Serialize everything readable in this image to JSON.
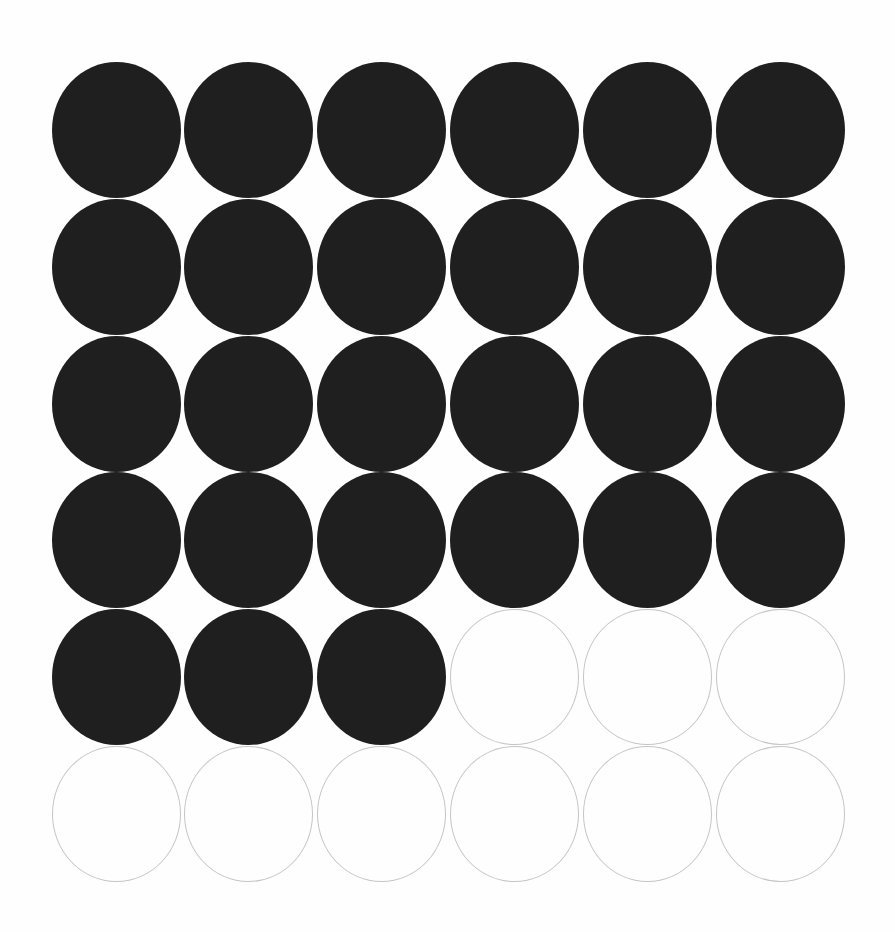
{
  "figure": {
    "type": "dot-grid",
    "rows": 6,
    "cols": 6,
    "cells": [
      [
        1,
        1,
        1,
        1,
        1,
        1
      ],
      [
        1,
        1,
        1,
        1,
        1,
        1
      ],
      [
        1,
        1,
        1,
        1,
        1,
        1
      ],
      [
        1,
        1,
        1,
        1,
        1,
        1
      ],
      [
        1,
        1,
        1,
        0,
        0,
        0
      ],
      [
        0,
        0,
        0,
        0,
        0,
        0
      ]
    ],
    "filled_count": 27,
    "empty_count": 9,
    "total_count": 36,
    "colors": {
      "filled_fill": "#1f1f1f",
      "empty_stroke": "#c5c5c5",
      "background": "#fefefe"
    }
  }
}
